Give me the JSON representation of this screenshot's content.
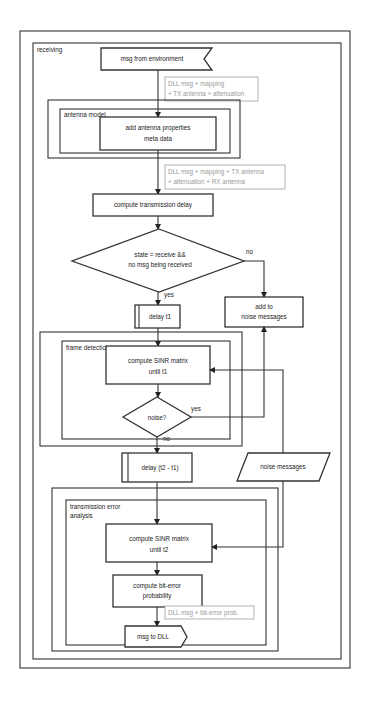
{
  "diagram": {
    "type": "flowchart",
    "frames": {
      "receiving": "receiving",
      "antenna_model": "antenna model",
      "frame_detection": "frame detection",
      "transmission_error_analysis_line1": "transmission error",
      "transmission_error_analysis_line2": "analysis"
    },
    "nodes": {
      "msg_from_env": "msg from environment",
      "add_antenna_line1": "add antenna properties",
      "add_antenna_line2": "meta data",
      "compute_delay": "compute transmission delay",
      "decision_line1": "state = receive &&",
      "decision_line2": "no msg being received",
      "delay_t1": "delay t1",
      "add_noise_line1": "add to",
      "add_noise_line2": "noise messages",
      "sinr_t1_line1": "compute SINR matrix",
      "sinr_t1_line2": "until t1",
      "noise_decision": "noise?",
      "delay_t2": "delay (t2 - t1)",
      "noise_messages": "noise messages",
      "sinr_t2_line1": "compute SINR matrix",
      "sinr_t2_line2": "until t2",
      "biterror_line1": "compute bit-error",
      "biterror_line2": "probability",
      "msg_to_dll": "msg to DLL"
    },
    "annotations": {
      "a1_line1": "DLL msg + mapping",
      "a1_line2": "+ TX antenna + attenuation",
      "a2_line1": "DLL msg + mapping + TX antenna",
      "a2_line2": "+ attenuation + RX antenna",
      "a3": "DLL msg + bit-error prob."
    },
    "edge_labels": {
      "no": "no",
      "yes": "yes",
      "noise_yes": "yes",
      "noise_no": "no"
    }
  }
}
